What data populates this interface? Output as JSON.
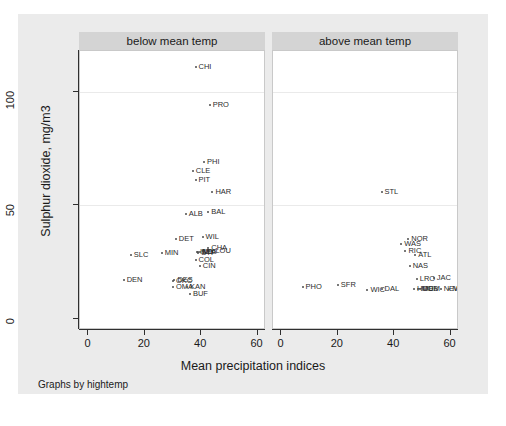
{
  "figure": {
    "note": "Graphs by hightemp",
    "xtitle": "Mean precipitation indices",
    "ytitle": "Sulphur dioxide, mg/m3",
    "background": "#ebebeb",
    "panel_header_color": "#d4d4d4"
  },
  "axes": {
    "x_ticks": [
      "0",
      "20",
      "40",
      "60"
    ],
    "x_values": [
      0,
      20,
      40,
      60
    ],
    "y_ticks": [
      "0",
      "50",
      "100"
    ],
    "y_values": [
      0,
      50,
      100
    ],
    "xlim": [
      -3,
      63
    ],
    "ylim": [
      -5,
      118
    ],
    "gridlines_y": [
      50,
      100
    ]
  },
  "panels": [
    {
      "label": "below mean temp"
    },
    {
      "label": "above mean temp"
    }
  ],
  "chart_data": {
    "type": "scatter",
    "title": "",
    "xlabel": "Mean precipitation indices",
    "ylabel": "Sulphur dioxide, mg/m3",
    "xlim": [
      -3,
      63
    ],
    "ylim": [
      -5,
      118
    ],
    "grid": true,
    "legend": "none",
    "facet_by": "hightemp",
    "facets": [
      {
        "name": "below mean temp",
        "points": [
          {
            "label": "CHI",
            "x": 38.0,
            "y": 111.0
          },
          {
            "label": "PRO",
            "x": 43.0,
            "y": 94.0
          },
          {
            "label": "PHI",
            "x": 41.0,
            "y": 69.0
          },
          {
            "label": "CLE",
            "x": 37.0,
            "y": 65.0
          },
          {
            "label": "PIT",
            "x": 38.0,
            "y": 61.0
          },
          {
            "label": "HAR",
            "x": 44.0,
            "y": 56.0
          },
          {
            "label": "BAL",
            "x": 42.5,
            "y": 47.0
          },
          {
            "label": "ALB",
            "x": 34.5,
            "y": 46.0
          },
          {
            "label": "WIL",
            "x": 40.5,
            "y": 36.0
          },
          {
            "label": "DET",
            "x": 31.0,
            "y": 35.0
          },
          {
            "label": "CHA",
            "x": 42.5,
            "y": 31.0
          },
          {
            "label": "LOU",
            "x": 44.0,
            "y": 30.0
          },
          {
            "label": "IND",
            "x": 38.5,
            "y": 29.5
          },
          {
            "label": "SEA",
            "x": 39.0,
            "y": 29.5
          },
          {
            "label": "MIL",
            "x": 39.5,
            "y": 29.5
          },
          {
            "label": "STP",
            "x": 39.0,
            "y": 29.0
          },
          {
            "label": "MIN",
            "x": 26.0,
            "y": 29.0
          },
          {
            "label": "SLC",
            "x": 15.0,
            "y": 28.0
          },
          {
            "label": "COL",
            "x": 38.0,
            "y": 26.0
          },
          {
            "label": "CIN",
            "x": 39.5,
            "y": 23.0
          },
          {
            "label": "DES",
            "x": 30.5,
            "y": 17.0
          },
          {
            "label": "OKC",
            "x": 30.0,
            "y": 16.5
          },
          {
            "label": "DEN",
            "x": 12.5,
            "y": 17.0
          },
          {
            "label": "OMA",
            "x": 30.0,
            "y": 14.0
          },
          {
            "label": "KAN",
            "x": 35.0,
            "y": 14.0
          },
          {
            "label": "BUF",
            "x": 36.0,
            "y": 11.0
          }
        ]
      },
      {
        "name": "above mean temp",
        "points": [
          {
            "label": "STL",
            "x": 35.5,
            "y": 56.0
          },
          {
            "label": "NOR",
            "x": 45.0,
            "y": 35.0
          },
          {
            "label": "WAS",
            "x": 42.5,
            "y": 33.0
          },
          {
            "label": "RIC",
            "x": 44.0,
            "y": 30.0
          },
          {
            "label": "ATL",
            "x": 47.5,
            "y": 28.0
          },
          {
            "label": "NAS",
            "x": 45.5,
            "y": 23.0
          },
          {
            "label": "LRO",
            "x": 48.0,
            "y": 17.5
          },
          {
            "label": "JAC",
            "x": 54.0,
            "y": 18.0
          },
          {
            "label": "SFR",
            "x": 20.0,
            "y": 15.0
          },
          {
            "label": "PHO",
            "x": 7.5,
            "y": 14.0
          },
          {
            "label": "WIC",
            "x": 30.5,
            "y": 12.5
          },
          {
            "label": "DAL",
            "x": 35.5,
            "y": 13.0
          },
          {
            "label": "HOU",
            "x": 47.0,
            "y": 13.0
          },
          {
            "label": "MEM",
            "x": 49.0,
            "y": 13.0
          },
          {
            "label": "MOB",
            "x": 48.5,
            "y": 13.0
          },
          {
            "label": "NEW",
            "x": 56.5,
            "y": 13.0
          },
          {
            "label": "MIA",
            "x": 59.5,
            "y": 13.0
          }
        ]
      }
    ]
  }
}
